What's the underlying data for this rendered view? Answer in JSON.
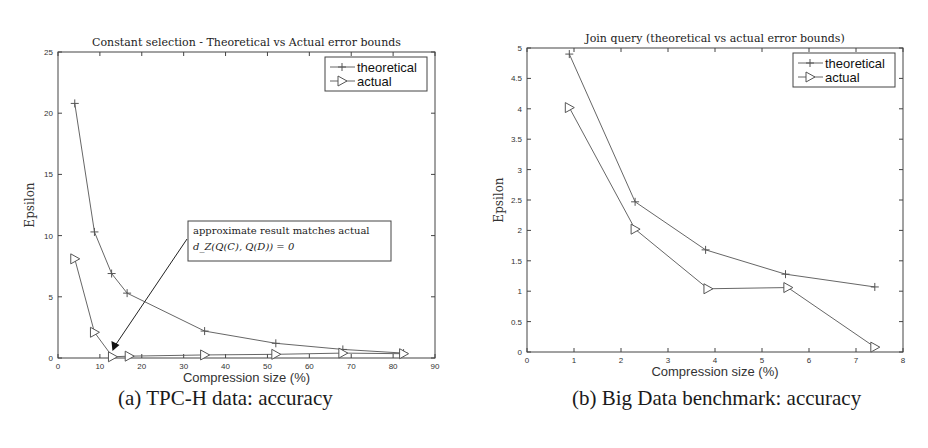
{
  "chart_data": [
    {
      "id": "left",
      "type": "line",
      "title": "Constant selection - Theoretical vs Actual error bounds",
      "xlabel": "Compression size (%)",
      "ylabel": "Epsilon",
      "xlim": [
        0,
        90
      ],
      "ylim": [
        0,
        25
      ],
      "xticks": [
        0,
        10,
        20,
        30,
        40,
        50,
        60,
        70,
        80,
        90
      ],
      "yticks": [
        0,
        5,
        10,
        15,
        20,
        25
      ],
      "grid": false,
      "legend_position": "upper right",
      "series": [
        {
          "name": "theoretical",
          "marker": "plus",
          "x": [
            4,
            8.7,
            12.8,
            16.5,
            35,
            52,
            68,
            82.5
          ],
          "y": [
            20.8,
            10.3,
            6.9,
            5.3,
            2.2,
            1.2,
            0.7,
            0.4
          ]
        },
        {
          "name": "actual",
          "marker": "triangle-right",
          "x": [
            4,
            8.7,
            13,
            17,
            35,
            52,
            68,
            82.5
          ],
          "y": [
            8.1,
            2.1,
            0.1,
            0.15,
            0.25,
            0.3,
            0.4,
            0.35
          ]
        }
      ],
      "annotation": {
        "line1": "approximate result matches actual",
        "line2": "d_Z(Q(C), Q(D)) = 0",
        "arrow_to": [
          13,
          0.4
        ]
      },
      "caption": "(a) TPC-H data: accuracy"
    },
    {
      "id": "right",
      "type": "line",
      "title": "Join query (theoretical vs actual error bounds)",
      "xlabel": "Compression size (%)",
      "ylabel": "Epsilon",
      "xlim": [
        0,
        8
      ],
      "ylim": [
        0,
        5
      ],
      "xticks": [
        0,
        1,
        2,
        3,
        4,
        5,
        6,
        7,
        8
      ],
      "yticks": [
        0,
        0.5,
        1,
        1.5,
        2,
        2.5,
        3,
        3.5,
        4,
        4.5,
        5
      ],
      "grid": false,
      "legend_position": "upper right",
      "series": [
        {
          "name": "theoretical",
          "marker": "plus",
          "x": [
            0.9,
            2.3,
            3.8,
            5.5,
            7.4
          ],
          "y": [
            4.9,
            2.47,
            1.68,
            1.28,
            1.07
          ]
        },
        {
          "name": "actual",
          "marker": "triangle-right",
          "x": [
            0.9,
            2.3,
            3.85,
            5.55,
            7.4
          ],
          "y": [
            4.02,
            2.02,
            1.04,
            1.06,
            0.08
          ]
        }
      ],
      "caption": "(b) Big Data benchmark: accuracy"
    }
  ],
  "layout": {
    "left": {
      "x0": 58,
      "x1": 435,
      "y0": 358,
      "y1": 52
    },
    "right": {
      "x0": 527,
      "x1": 903,
      "y0": 352,
      "y1": 48
    }
  },
  "captions": {
    "left": "(a) TPC-H data: accuracy",
    "right": "(b) Big Data benchmark: accuracy"
  },
  "colors": {
    "line": "#555555",
    "frame": "#444444",
    "text": "#222222"
  }
}
